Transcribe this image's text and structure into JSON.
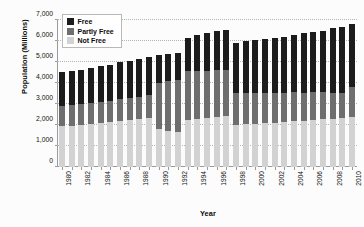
{
  "chart_data": {
    "type": "bar",
    "stacked": true,
    "title": "",
    "xlabel": "Year",
    "ylabel": "Population (Millions)",
    "ylim": [
      0,
      7000
    ],
    "ytick_labels": [
      "0",
      "1,000",
      "2,000",
      "3,000",
      "4,000",
      "5,000",
      "6,000",
      "7,000"
    ],
    "ytick_values": [
      0,
      1000,
      2000,
      3000,
      4000,
      5000,
      6000,
      7000
    ],
    "grid": true,
    "grid_style": "dotted-horizontal",
    "legend_position": "top-left-inside",
    "categories": [
      "1980",
      "1981",
      "1982",
      "1983",
      "1984",
      "1985",
      "1986",
      "1987",
      "1988",
      "1989",
      "1990",
      "1991",
      "1992",
      "1993",
      "1994",
      "1995",
      "1996",
      "1997",
      "1998",
      "1999",
      "2000",
      "2001",
      "2002",
      "2003",
      "2004",
      "2005",
      "2006",
      "2007",
      "2008",
      "2009",
      "2010"
    ],
    "xtick_labels_shown": [
      "1980",
      "1982",
      "1984",
      "1986",
      "1988",
      "1990",
      "1992",
      "1994",
      "1996",
      "1998",
      "2000",
      "2002",
      "2004",
      "2006",
      "2008",
      "2010"
    ],
    "series": [
      {
        "name": "Not Free",
        "color": "#d2d2d2",
        "values": [
          1940,
          1975,
          2010,
          2050,
          2090,
          2130,
          2190,
          2240,
          2300,
          2345,
          1800,
          1725,
          1680,
          2260,
          2300,
          2350,
          2400,
          2450,
          1990,
          2030,
          2060,
          2085,
          2110,
          2140,
          2180,
          2210,
          2250,
          2270,
          2300,
          2330,
          2365
        ]
      },
      {
        "name": "Partly Free",
        "color": "#6e6e6e",
        "values": [
          985,
          990,
          1000,
          1005,
          1010,
          1020,
          1030,
          1040,
          1055,
          1075,
          2220,
          2375,
          2480,
          2290,
          2255,
          2235,
          2210,
          2180,
          1520,
          1500,
          1470,
          1450,
          1420,
          1400,
          1370,
          1330,
          1300,
          1280,
          1240,
          1210,
          1450
        ]
      },
      {
        "name": "Free",
        "color": "#1c1c1c",
        "values": [
          1585,
          1600,
          1615,
          1640,
          1695,
          1710,
          1760,
          1780,
          1810,
          1830,
          1300,
          1280,
          1255,
          1605,
          1740,
          1810,
          1860,
          1890,
          2400,
          2450,
          2500,
          2545,
          2600,
          2660,
          2740,
          2820,
          2880,
          2950,
          3060,
          3130,
          3010
        ]
      }
    ]
  },
  "legend": {
    "items": [
      {
        "label": "Free",
        "color": "#1c1c1c"
      },
      {
        "label": "Partly Free",
        "color": "#6e6e6e"
      },
      {
        "label": "Not Free",
        "color": "#d2d2d2"
      }
    ]
  }
}
